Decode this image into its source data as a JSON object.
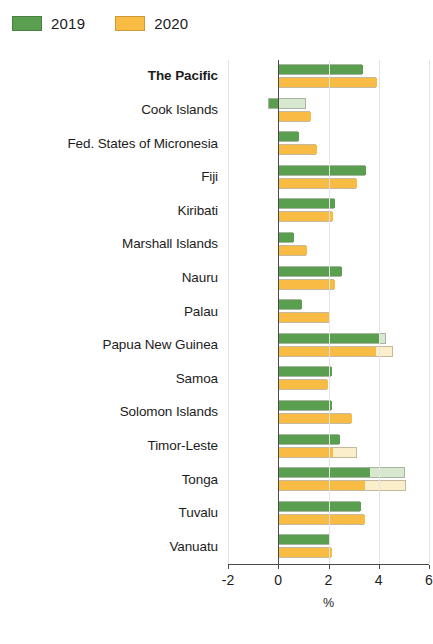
{
  "legend": {
    "entries": [
      {
        "label": "2019",
        "color": "#5a9e4f"
      },
      {
        "label": "2020",
        "color": "#f8bc45"
      }
    ]
  },
  "axis": {
    "title": "%",
    "ticks": [
      "-2",
      "0",
      "2",
      "4",
      "6"
    ]
  },
  "chart_data": {
    "type": "bar",
    "orientation": "horizontal",
    "title": "",
    "subtitle": "",
    "xlabel": "%",
    "ylabel": "",
    "xlim": [
      -2,
      6
    ],
    "xticks": [
      -2,
      0,
      2,
      4,
      6
    ],
    "grid": false,
    "legend_position": "top-left",
    "categories": [
      "The Pacific",
      "Cook Islands",
      "Fed. States of Micronesia",
      "Fiji",
      "Kiribati",
      "Marshall Islands",
      "Nauru",
      "Palau",
      "Papua New Guinea",
      "Samoa",
      "Solomon Islands",
      "Timor-Leste",
      "Tonga",
      "Tuvalu",
      "Vanuatu"
    ],
    "highlight_category": "The Pacific",
    "series": [
      {
        "name": "2019",
        "color": "#5a9e4f",
        "light_color": "#d8e8cf",
        "values": [
          3.35,
          -0.4,
          0.8,
          3.45,
          2.2,
          0.6,
          2.5,
          0.9,
          4.0,
          2.1,
          2.1,
          2.4,
          3.6,
          3.25,
          2.0
        ],
        "outer_values": [
          3.35,
          1.1,
          0.8,
          3.45,
          2.2,
          0.6,
          2.5,
          0.9,
          4.3,
          2.1,
          2.1,
          2.4,
          5.05,
          3.25,
          2.0
        ]
      },
      {
        "name": "2020",
        "color": "#f8bc45",
        "light_color": "#fbeecb",
        "values": [
          3.9,
          1.25,
          1.5,
          3.1,
          2.15,
          1.1,
          2.2,
          2.0,
          3.85,
          1.95,
          2.9,
          2.15,
          3.4,
          3.4,
          2.1
        ],
        "outer_values": [
          3.9,
          1.25,
          1.5,
          3.1,
          2.15,
          1.1,
          2.2,
          2.0,
          4.55,
          1.95,
          2.9,
          3.15,
          5.1,
          3.4,
          2.1
        ]
      }
    ]
  }
}
